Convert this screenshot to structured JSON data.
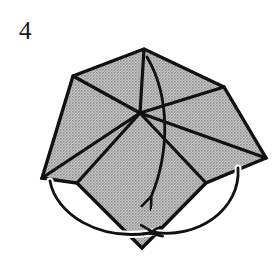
{
  "figure": {
    "step_number": "4",
    "kind": "origami-fold-diagram",
    "canvas": {
      "width": 279,
      "height": 265
    },
    "colors": {
      "paper_fill": "#b2b2b2",
      "paper_fill_pattern": "halftone-gray",
      "line": "#111111",
      "background": "#ffffff",
      "number": "#1a1a1a"
    },
    "shape": {
      "name": "folded-paper-silhouette",
      "outline_points": "144,49 224,87 266,158 206,183 142,248 77,183 42,178 73,76",
      "vertices": [
        {
          "name": "top",
          "x": 144,
          "y": 49
        },
        {
          "name": "upper-right",
          "x": 224,
          "y": 87
        },
        {
          "name": "right",
          "x": 266,
          "y": 158
        },
        {
          "name": "lower-right",
          "x": 206,
          "y": 183
        },
        {
          "name": "bottom-tip",
          "x": 142,
          "y": 248
        },
        {
          "name": "lower-left",
          "x": 77,
          "y": 183
        },
        {
          "name": "left",
          "x": 42,
          "y": 178
        },
        {
          "name": "upper-left",
          "x": 73,
          "y": 76
        }
      ],
      "center": {
        "x": 140,
        "y": 113
      }
    },
    "crease_lines": [
      {
        "name": "center-to-top",
        "from": [
          140,
          113
        ],
        "to": [
          144,
          49
        ]
      },
      {
        "name": "center-to-upper-left",
        "from": [
          140,
          113
        ],
        "to": [
          73,
          76
        ]
      },
      {
        "name": "center-to-upper-right",
        "from": [
          140,
          113
        ],
        "to": [
          224,
          87
        ]
      },
      {
        "name": "center-to-right",
        "from": [
          140,
          113
        ],
        "to": [
          266,
          158
        ]
      },
      {
        "name": "center-to-left",
        "from": [
          140,
          113
        ],
        "to": [
          42,
          178
        ]
      },
      {
        "name": "center-to-lower-left",
        "from": [
          140,
          113
        ],
        "to": [
          77,
          183
        ]
      },
      {
        "name": "center-to-lower-right",
        "from": [
          140,
          113
        ],
        "to": [
          206,
          183
        ]
      }
    ],
    "arrows": [
      {
        "name": "center-fold-arrow",
        "label": "fold down through middle",
        "path": "M 147 57 C 168 95, 168 150, 150 196",
        "arrowhead_at": [
          150,
          196
        ],
        "arrowhead_direction": "down-left"
      },
      {
        "name": "left-wrap-arrow",
        "label": "wrap left flap under to bottom",
        "path": "M 50 181 C 58 216, 100 240, 148 233",
        "arrowhead_at": [
          148,
          233
        ],
        "arrowhead_direction": "right-up"
      },
      {
        "name": "right-wrap-arrow",
        "label": "wrap right flap under to bottom",
        "path": "M 238 168 C 240 208, 198 238, 150 232",
        "arrowhead_at": [
          150,
          232
        ],
        "arrowhead_direction": "left-up"
      }
    ]
  }
}
